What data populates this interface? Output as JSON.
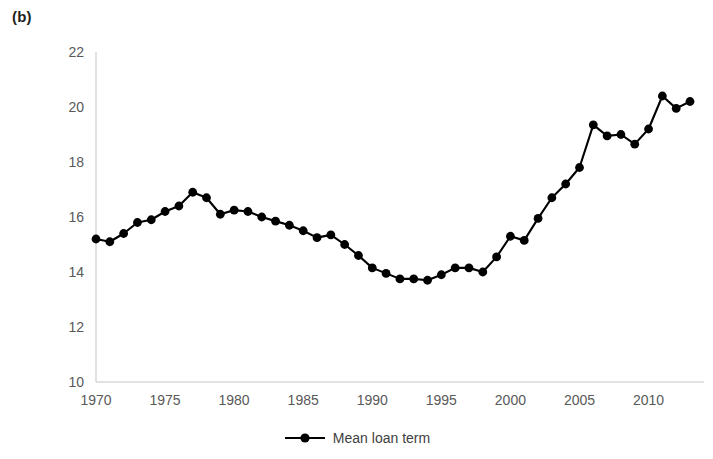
{
  "panel": {
    "label": "(b)"
  },
  "legend": {
    "position": "bottom-center",
    "entries": [
      {
        "label": "Mean loan term",
        "marker": "circle",
        "color": "#000000"
      }
    ]
  },
  "axes": {
    "y_ticks": [
      "22",
      "20",
      "18",
      "16",
      "14",
      "12",
      "10"
    ],
    "x_ticks": [
      "1970",
      "1975",
      "1980",
      "1985",
      "1990",
      "1995",
      "2000",
      "2005",
      "2010"
    ]
  },
  "style": {
    "line_color": "#000000",
    "marker_color": "#000000",
    "tick_label_color": "#595959",
    "axis_color": "#d9d9d9",
    "background": "#ffffff"
  },
  "chart_data": {
    "type": "line",
    "title": "",
    "subtitle": "",
    "xlabel": "",
    "ylabel": "",
    "xlim": [
      1970,
      2013
    ],
    "ylim": [
      10,
      22
    ],
    "ytick_step": 2,
    "xtick_step": 5,
    "grid": false,
    "legend_position": "bottom-center",
    "x": [
      1970,
      1971,
      1972,
      1973,
      1974,
      1975,
      1976,
      1977,
      1978,
      1979,
      1980,
      1981,
      1982,
      1983,
      1984,
      1985,
      1986,
      1987,
      1988,
      1989,
      1990,
      1991,
      1992,
      1993,
      1994,
      1995,
      1996,
      1997,
      1998,
      1999,
      2000,
      2001,
      2002,
      2003,
      2004,
      2005,
      2006,
      2007,
      2008,
      2009,
      2010,
      2011,
      2012,
      2013
    ],
    "series": [
      {
        "name": "Mean loan term",
        "color": "#000000",
        "values": [
          15.2,
          15.1,
          15.4,
          15.8,
          15.9,
          16.2,
          16.4,
          16.9,
          16.7,
          16.1,
          16.25,
          16.2,
          16.0,
          15.85,
          15.7,
          15.5,
          15.25,
          15.35,
          15.0,
          14.6,
          14.15,
          13.95,
          13.75,
          13.75,
          13.7,
          13.9,
          14.15,
          14.15,
          14.0,
          14.55,
          15.3,
          15.15,
          15.95,
          16.7,
          17.2,
          17.8,
          19.35,
          18.95,
          19.0,
          18.65,
          19.2,
          20.4,
          19.95,
          20.2
        ]
      }
    ]
  }
}
